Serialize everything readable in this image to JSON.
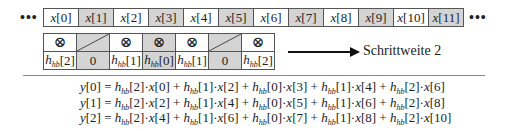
{
  "input_row": {
    "leading_ellipsis": "•••",
    "trailing_ellipsis": "•••",
    "cells": [
      {
        "var": "x",
        "index": "0",
        "shaded": false
      },
      {
        "var": "x",
        "index": "1",
        "shaded": true
      },
      {
        "var": "x",
        "index": "2",
        "shaded": false
      },
      {
        "var": "x",
        "index": "3",
        "shaded": true
      },
      {
        "var": "x",
        "index": "4",
        "shaded": false
      },
      {
        "var": "x",
        "index": "5",
        "shaded": true
      },
      {
        "var": "x",
        "index": "6",
        "shaded": false
      },
      {
        "var": "x",
        "index": "7",
        "shaded": true
      },
      {
        "var": "x",
        "index": "8",
        "shaded": false
      },
      {
        "var": "x",
        "index": "9",
        "shaded": true
      },
      {
        "var": "x",
        "index": "10",
        "shaded": false
      },
      {
        "var": "x",
        "index": "11",
        "shaded": true
      }
    ]
  },
  "filter_row": {
    "multiply_symbol": "⊗",
    "columns": [
      {
        "top": "multiply",
        "coef": "h",
        "sub": "hb",
        "index": "2",
        "shaded": false
      },
      {
        "top": "diagonal",
        "value": "0",
        "shaded": true
      },
      {
        "top": "multiply",
        "coef": "h",
        "sub": "hb",
        "index": "1",
        "shaded": false
      },
      {
        "top": "multiply",
        "coef": "h",
        "sub": "hb",
        "index": "0",
        "shaded": true
      },
      {
        "top": "multiply",
        "coef": "h",
        "sub": "hb",
        "index": "1",
        "shaded": false
      },
      {
        "top": "diagonal",
        "value": "0",
        "shaded": true
      },
      {
        "top": "multiply",
        "coef": "h",
        "sub": "hb",
        "index": "2",
        "shaded": false
      }
    ]
  },
  "step_label": "Schrittweite 2",
  "colors": {
    "shade": "#d4d4d4",
    "border": "#555555",
    "arrow": "#111111"
  },
  "equations": [
    {
      "lhs": "y[0]",
      "terms": [
        [
          "2",
          "0"
        ],
        [
          "1",
          "2"
        ],
        [
          "0",
          "3"
        ],
        [
          "1",
          "4"
        ],
        [
          "2",
          "6"
        ]
      ]
    },
    {
      "lhs": "y[1]",
      "terms": [
        [
          "2",
          "2"
        ],
        [
          "1",
          "4"
        ],
        [
          "0",
          "5"
        ],
        [
          "1",
          "6"
        ],
        [
          "2",
          "8"
        ]
      ]
    },
    {
      "lhs": "y[2]",
      "terms": [
        [
          "2",
          "4"
        ],
        [
          "1",
          "6"
        ],
        [
          "0",
          "7"
        ],
        [
          "1",
          "8"
        ],
        [
          "2",
          "10"
        ]
      ]
    }
  ]
}
